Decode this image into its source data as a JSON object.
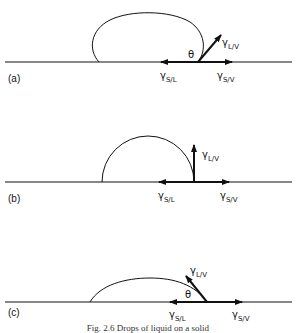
{
  "figure": {
    "caption": "Fig. 2.6  Drops of liquid on a solid",
    "panels": [
      {
        "id": "a",
        "label": "(a)",
        "gamma_lv": {
          "sym": "γ",
          "sub": "L/V"
        },
        "gamma_sl": {
          "sym": "γ",
          "sub": "S/L"
        },
        "gamma_sv": {
          "sym": "γ",
          "sub": "S/V"
        },
        "angle": "θ",
        "description": "contact angle greater than 90°"
      },
      {
        "id": "b",
        "label": "(b)",
        "gamma_lv": {
          "sym": "γ",
          "sub": "L/V"
        },
        "gamma_sl": {
          "sym": "γ",
          "sub": "S/L"
        },
        "gamma_sv": {
          "sym": "γ",
          "sub": "S/V"
        },
        "description": "contact angle equal to 90°"
      },
      {
        "id": "c",
        "label": "(c)",
        "gamma_lv": {
          "sym": "γ",
          "sub": "L/V"
        },
        "gamma_sl": {
          "sym": "γ",
          "sub": "S/L"
        },
        "gamma_sv": {
          "sym": "γ",
          "sub": "S/V"
        },
        "angle": "θ",
        "description": "contact angle less than 90°"
      }
    ]
  }
}
